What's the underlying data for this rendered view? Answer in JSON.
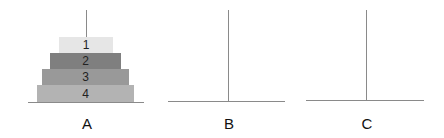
{
  "pegs": [
    {
      "label": "A",
      "x": 86,
      "base_left": 28,
      "base_right": 144,
      "base_y": 102
    },
    {
      "label": "B",
      "x": 228,
      "base_left": 168,
      "base_right": 285,
      "base_y": 101
    },
    {
      "label": "C",
      "x": 366,
      "base_left": 306,
      "base_right": 424,
      "base_y": 100
    }
  ],
  "disks": [
    {
      "number": "1",
      "peg": "A",
      "left": 59,
      "right": 113,
      "top": 37,
      "color": "#e6e6e6"
    },
    {
      "number": "2",
      "peg": "A",
      "left": 50,
      "right": 121,
      "top": 53,
      "color": "#7f7f7f"
    },
    {
      "number": "3",
      "peg": "A",
      "left": 42,
      "right": 129,
      "top": 69,
      "color": "#999999"
    },
    {
      "number": "4",
      "peg": "A",
      "left": 37,
      "right": 134,
      "top": 85,
      "color": "#b3b3b3"
    }
  ],
  "colors": {
    "line": "#8a8a8a",
    "text": "#111111"
  }
}
